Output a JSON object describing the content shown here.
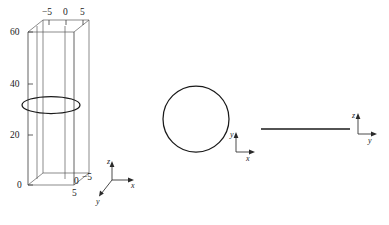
{
  "figure": {
    "caption_faint": "",
    "panels": [
      {
        "id": "panel-3d-cylinder",
        "type": "3d-box-with-ellipse",
        "description": "3D bounding box with vertical cylinder and horizontal ellipse cross-section",
        "vertical_axis": {
          "name": "z",
          "tick_labels": [
            "60",
            "40",
            "20",
            "0"
          ],
          "tick_values": [
            60,
            40,
            20,
            0
          ],
          "range": [
            0,
            60
          ]
        },
        "top_axis": {
          "name": "x",
          "tick_labels": [
            "−5",
            "0",
            "5"
          ],
          "tick_values": [
            -5,
            0,
            5
          ],
          "range": [
            -5,
            5
          ]
        },
        "depth_axis": {
          "name": "y",
          "tick_labels": [
            "−5",
            "0",
            "5"
          ],
          "tick_values": [
            -5,
            0,
            5
          ],
          "range": [
            -5,
            5
          ]
        },
        "bottom_corner_labels": [
          "0",
          "−5",
          "5"
        ],
        "triad": {
          "z": "z",
          "x": "x",
          "y": "y"
        }
      },
      {
        "id": "panel-circle-xy",
        "type": "circle",
        "description": "Top view of the cylinder projected onto the x-y plane",
        "triad": {
          "y": "y",
          "x": "x"
        }
      },
      {
        "id": "panel-line-zy",
        "type": "line",
        "description": "Side view collapsed to a horizontal line in the z-y plane",
        "triad": {
          "z": "z",
          "y": "y"
        }
      }
    ]
  },
  "labels": {
    "z60": "60",
    "z40": "40",
    "z20": "20",
    "z0": "0",
    "xm5": "−5",
    "x0": "0",
    "x5": "5",
    "corner0": "0",
    "cornerM5": "−5",
    "corner5": "5",
    "axis_z": "z",
    "axis_x": "x",
    "axis_y": "y",
    "axis_y2": "y",
    "axis_x2": "x",
    "axis_z3": "z",
    "axis_y3": "y"
  },
  "colors": {
    "ink": "#1a1a1a",
    "box_edge": "#5a5a5a",
    "background": "#ffffff"
  }
}
